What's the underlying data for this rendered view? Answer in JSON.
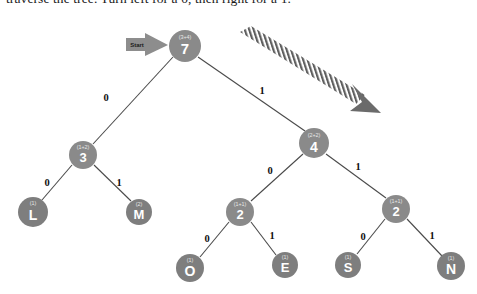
{
  "caption": {
    "text": "traverse the tree. Turn left for a 0, then right for a 1."
  },
  "colors": {
    "node_fill": "#8a8a8a",
    "leaf_fill": "#7e7e7e",
    "node_text": "#ffffff",
    "weight_text": "#e8e8e8",
    "edge_stroke": "#4a4a4a",
    "edge_label": "#111111",
    "start_marker": "#8d8d8d",
    "hatch_arrow": "#6b6b6b",
    "background": "#ffffff"
  },
  "start_marker": {
    "label": "Start",
    "icon": "right-arrow-icon"
  },
  "direction_arrow": {
    "icon": "hatched-diagonal-arrow-icon",
    "description": "striped arrow pointing down-right"
  },
  "tree": {
    "type": "huffman-tree",
    "nodes": [
      {
        "id": "root",
        "value": "7",
        "weight": "(3+4)",
        "kind": "internal",
        "cx": 185,
        "cy": 46,
        "r": 16
      },
      {
        "id": "n3",
        "value": "3",
        "weight": "(1+2)",
        "kind": "internal",
        "cx": 83,
        "cy": 155,
        "r": 14
      },
      {
        "id": "n4",
        "value": "4",
        "weight": "(2+2)",
        "kind": "internal",
        "cx": 314,
        "cy": 143,
        "r": 15
      },
      {
        "id": "leafL",
        "value": "L",
        "weight": "(1)",
        "kind": "leaf",
        "cx": 33,
        "cy": 212,
        "r": 15
      },
      {
        "id": "leafM",
        "value": "M",
        "weight": "(2)",
        "kind": "leaf",
        "cx": 139,
        "cy": 212,
        "r": 13
      },
      {
        "id": "n2a",
        "value": "2",
        "weight": "(1+1)",
        "kind": "internal",
        "cx": 240,
        "cy": 212,
        "r": 14
      },
      {
        "id": "n2b",
        "value": "2",
        "weight": "(1+1)",
        "kind": "internal",
        "cx": 396,
        "cy": 209,
        "r": 14
      },
      {
        "id": "leafO",
        "value": "O",
        "weight": "(1)",
        "kind": "leaf",
        "cx": 190,
        "cy": 268,
        "r": 14
      },
      {
        "id": "leafE",
        "value": "E",
        "weight": "(1)",
        "kind": "leaf",
        "cx": 285,
        "cy": 265,
        "r": 13
      },
      {
        "id": "leafS",
        "value": "S",
        "weight": "(1)",
        "kind": "leaf",
        "cx": 348,
        "cy": 265,
        "r": 13
      },
      {
        "id": "leafN",
        "value": "N",
        "weight": "(1)",
        "kind": "leaf",
        "cx": 451,
        "cy": 266,
        "r": 14
      }
    ],
    "edges": [
      {
        "from": "root",
        "to": "n3",
        "label": "0",
        "lx": 106,
        "ly": 99
      },
      {
        "from": "root",
        "to": "n4",
        "label": "1",
        "lx": 262,
        "ly": 92
      },
      {
        "from": "n3",
        "to": "leafL",
        "label": "0",
        "lx": 47,
        "ly": 184
      },
      {
        "from": "n3",
        "to": "leafM",
        "label": "1",
        "lx": 119,
        "ly": 184
      },
      {
        "from": "n4",
        "to": "n2a",
        "label": "0",
        "lx": 270,
        "ly": 172
      },
      {
        "from": "n4",
        "to": "n2b",
        "label": "1",
        "lx": 358,
        "ly": 168
      },
      {
        "from": "n2a",
        "to": "leafO",
        "label": "0",
        "lx": 207,
        "ly": 240
      },
      {
        "from": "n2a",
        "to": "leafE",
        "label": "1",
        "lx": 272,
        "ly": 237
      },
      {
        "from": "n2b",
        "to": "leafS",
        "label": "0",
        "lx": 363,
        "ly": 238
      },
      {
        "from": "n2b",
        "to": "leafN",
        "label": "1",
        "lx": 432,
        "ly": 237
      }
    ]
  }
}
